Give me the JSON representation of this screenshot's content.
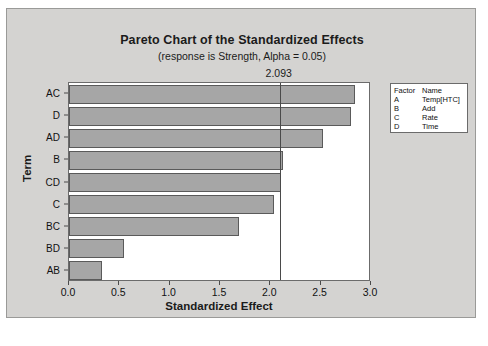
{
  "chart_data": {
    "type": "bar",
    "orientation": "horizontal",
    "title": "Pareto Chart of the Standardized Effects",
    "subtitle": "(response is Strength, Alpha = 0.05)",
    "xlabel": "Standardized Effect",
    "ylabel": "Term",
    "categories": [
      "AC",
      "D",
      "AD",
      "B",
      "CD",
      "C",
      "BC",
      "BD",
      "AB"
    ],
    "values": [
      2.84,
      2.8,
      2.52,
      2.13,
      2.11,
      2.04,
      1.69,
      0.55,
      0.33
    ],
    "xlim": [
      0.0,
      3.0
    ],
    "xticks": [
      "0.0",
      "0.5",
      "1.0",
      "1.5",
      "2.0",
      "2.5",
      "3.0"
    ],
    "xtick_values": [
      0.0,
      0.5,
      1.0,
      1.5,
      2.0,
      2.5,
      3.0
    ],
    "reference_line": {
      "value": 2.093,
      "label": "2.093"
    },
    "grid": false,
    "legend_position": "right",
    "bar_color": "#a6a6a6",
    "bar_edge_color": "#5a5a5a",
    "plot_background": "#ffffff",
    "frame_background": "#d4d3d1"
  },
  "legend": {
    "header": {
      "code": "Factor",
      "name": "Name"
    },
    "rows": [
      {
        "code": "A",
        "name": "Temp[HTC]"
      },
      {
        "code": "B",
        "name": "Add"
      },
      {
        "code": "C",
        "name": "Rate"
      },
      {
        "code": "D",
        "name": "Time"
      }
    ]
  }
}
